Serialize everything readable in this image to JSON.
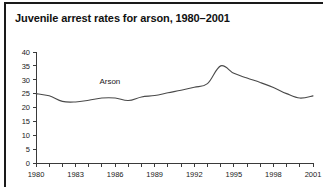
{
  "chart_data": {
    "type": "line",
    "title": "Juvenile arrest rates for arson, 1980–2001",
    "xlabel": "",
    "ylabel": "",
    "grid": false,
    "legend_position": "inline-annotation",
    "xlim": [
      1980,
      2001
    ],
    "ylim": [
      0,
      40
    ],
    "ytick_labels": [
      "0",
      "5",
      "10",
      "15",
      "20",
      "25",
      "30",
      "35",
      "40"
    ],
    "ytick_values": [
      0,
      5,
      10,
      15,
      20,
      25,
      30,
      35,
      40
    ],
    "xtick_labels": [
      "1980",
      "1983",
      "1986",
      "1989",
      "1992",
      "1995",
      "1998",
      "2001"
    ],
    "xtick_values": [
      1980,
      1983,
      1986,
      1989,
      1992,
      1995,
      1998,
      2001
    ],
    "minor_xticks_every": 1,
    "x": [
      1980,
      1981,
      1982,
      1983,
      1984,
      1985,
      1986,
      1987,
      1988,
      1989,
      1990,
      1991,
      1992,
      1993,
      1994,
      1995,
      1996,
      1997,
      1998,
      1999,
      2000,
      2001
    ],
    "series": [
      {
        "name": "Arson",
        "annotation": "Arson",
        "color": "#4a4a4a",
        "values": [
          25.0,
          24.2,
          22.2,
          22.0,
          22.6,
          23.4,
          23.4,
          22.5,
          23.8,
          24.3,
          25.3,
          26.2,
          27.3,
          28.6,
          35.0,
          32.3,
          30.6,
          29.0,
          27.2,
          25.0,
          23.4,
          24.2
        ]
      }
    ]
  },
  "figure": {
    "title": "Juvenile arrest rates for arson, 1980–2001",
    "series_annotation": "Arson",
    "background_color": "#ffffff",
    "border_color": "#1a1a1a",
    "line_color": "#4a4a4a",
    "axis_color": "#3a3a3a",
    "text_color": "#1a1a1a"
  }
}
